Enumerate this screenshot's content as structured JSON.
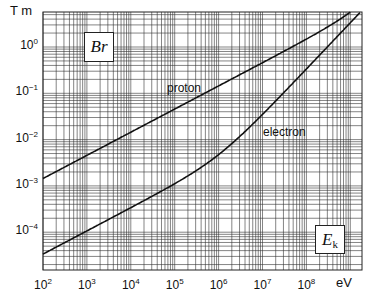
{
  "chart_data": {
    "type": "line",
    "title": "",
    "xlabel": "eV",
    "ylabel": "T m",
    "xscale": "log",
    "yscale": "log",
    "xlim": [
      100,
      1900000000.0
    ],
    "ylim": [
      1.5e-05,
      5.8
    ],
    "grid": true,
    "legend": "inline labels",
    "x_ticks": [
      "10^2",
      "10^3",
      "10^4",
      "10^5",
      "10^6",
      "10^7",
      "10^8"
    ],
    "y_ticks": [
      "10^0",
      "10^-1",
      "10^-2",
      "10^-3",
      "10^-4"
    ],
    "annotations": [
      "Br",
      "E_k"
    ],
    "x": [
      100.0,
      1000.0,
      10000.0,
      100000.0,
      1000000.0,
      3000000.0,
      10000000.0,
      30000000.0,
      100000000.0,
      300000000.0,
      1000000000.0,
      1900000000.0
    ],
    "series": [
      {
        "name": "proton",
        "values": [
          0.00145,
          0.00457,
          0.01445,
          0.0457,
          0.1445,
          0.2504,
          0.4572,
          0.7935,
          1.4559,
          2.6467,
          5.6605,
          8.9
        ]
      },
      {
        "name": "electron",
        "values": [
          3.37e-05,
          0.0001067,
          0.000338,
          0.001093,
          0.00474,
          0.0117,
          0.0351,
          0.1017,
          0.3352,
          1.0023,
          3.337,
          6.34
        ]
      }
    ]
  },
  "axes": {
    "y_unit": "T m",
    "x_unit": "eV",
    "y_tick_labels": [
      {
        "base": "10",
        "exp": "0",
        "v": 0
      },
      {
        "base": "10",
        "exp": "−1",
        "v": -1
      },
      {
        "base": "10",
        "exp": "−2",
        "v": -2
      },
      {
        "base": "10",
        "exp": "−3",
        "v": -3
      },
      {
        "base": "10",
        "exp": "−4",
        "v": -4
      }
    ],
    "x_tick_labels": [
      {
        "base": "10",
        "exp": "2",
        "v": 2
      },
      {
        "base": "10",
        "exp": "3",
        "v": 3
      },
      {
        "base": "10",
        "exp": "4",
        "v": 4
      },
      {
        "base": "10",
        "exp": "5",
        "v": 5
      },
      {
        "base": "10",
        "exp": "6",
        "v": 6
      },
      {
        "base": "10",
        "exp": "7",
        "v": 7
      },
      {
        "base": "10",
        "exp": "8",
        "v": 8
      }
    ]
  },
  "labels": {
    "proton": "proton",
    "electron": "electron",
    "br_main": "Br",
    "ek_main": "E",
    "ek_sub": "k"
  }
}
